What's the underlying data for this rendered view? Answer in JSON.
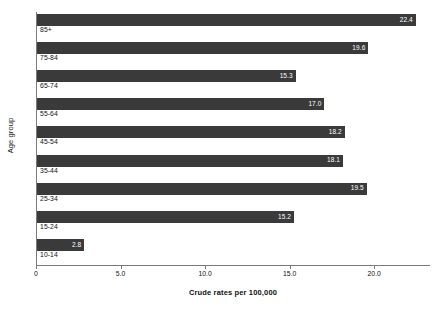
{
  "chart_data": {
    "type": "bar",
    "orientation": "horizontal",
    "title": "",
    "xlabel": "Crude rates per 100,000",
    "ylabel": "Age group",
    "categories": [
      "85+",
      "75-84",
      "65-74",
      "55-64",
      "45-54",
      "35-44",
      "25-34",
      "15-24",
      "10-14"
    ],
    "values": [
      22.4,
      19.6,
      15.3,
      17.0,
      18.2,
      18.1,
      19.5,
      15.2,
      2.8
    ],
    "value_labels": [
      "22.4",
      "19.6",
      "15.3",
      "17.0",
      "18.2",
      "18.1",
      "19.5",
      "15.2",
      "2.8"
    ],
    "xlim": [
      0,
      23.3
    ],
    "xticks": [
      0,
      5,
      10,
      15,
      20
    ],
    "xtick_labels": [
      "0",
      "5.0",
      "10.0",
      "15.0",
      "20.0"
    ],
    "grid": false,
    "legend": null,
    "bar_color": "#3a3a3a",
    "value_label_color": "#ffffff",
    "axis_color": "#7a7a7a"
  },
  "axes": {
    "y_title": "Age group",
    "x_title": "Crude rates per 100,000"
  }
}
